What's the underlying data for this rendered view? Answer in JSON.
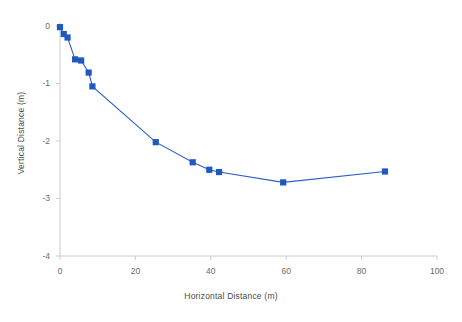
{
  "chart_data": {
    "type": "line",
    "title": "",
    "xlabel": "Horizontal Distance (m)",
    "ylabel": "Vertical Distance (m)",
    "xlim": [
      0,
      100
    ],
    "ylim": [
      -4,
      0
    ],
    "xticks": [
      0,
      20,
      40,
      60,
      80,
      100
    ],
    "yticks": [
      0,
      -1,
      -2,
      -3,
      -4
    ],
    "xtick_labels": [
      "0",
      "20",
      "40",
      "60",
      "80",
      "100"
    ],
    "ytick_labels": [
      "0",
      "-1",
      "-2",
      "-3",
      "-4"
    ],
    "grid": false,
    "legend": null,
    "series": [
      {
        "name": "profile",
        "marker": "square",
        "color": "#1f58bf",
        "line_color": "#2b5fc4",
        "x": [
          0,
          1,
          2,
          4,
          5.6,
          7.6,
          8.6,
          25.4,
          35.2,
          39.6,
          42.2,
          59.2,
          86.2
        ],
        "y": [
          -0.02,
          -0.14,
          -0.2,
          -0.58,
          -0.6,
          -0.81,
          -1.05,
          -2.02,
          -2.37,
          -2.5,
          -2.54,
          -2.72,
          -2.53
        ]
      }
    ]
  },
  "axes": {
    "x_title": "Horizontal Distance (m)",
    "y_title": "Vertical Distance (m)"
  },
  "colors": {
    "marker": "#1f58bf",
    "line": "#2b5fc4",
    "axis": "#c9c9c9",
    "tick_text": "#6b6b6b",
    "background": "#ffffff"
  }
}
